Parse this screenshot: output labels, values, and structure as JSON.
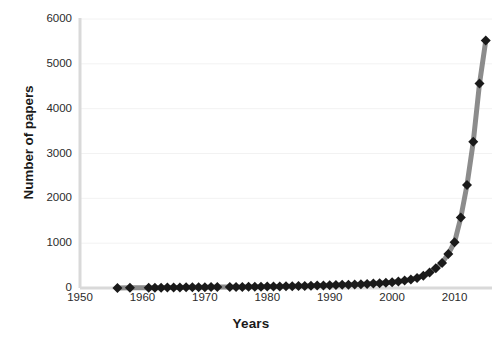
{
  "chart_data": {
    "type": "line",
    "title": "",
    "xlabel": "Years",
    "ylabel": "Number of papers",
    "xlim": [
      1950,
      2016
    ],
    "ylim": [
      0,
      6000
    ],
    "grid": true,
    "legend": "none",
    "marker": "diamond",
    "marker_color": "#1a1a1a",
    "line_color": "#8c8c8c",
    "gridline_color": "#f2f2f2",
    "axis_color": "#d9d9d9",
    "x_ticks": [
      1950,
      1960,
      1970,
      1980,
      1990,
      2000,
      2010
    ],
    "x_tick_labels": [
      "1950",
      "1960",
      "1970",
      "1980",
      "1990",
      "2000",
      "2010"
    ],
    "y_ticks": [
      0,
      1000,
      2000,
      3000,
      4000,
      5000,
      6000
    ],
    "y_tick_labels": [
      "0",
      "1000",
      "2000",
      "3000",
      "4000",
      "5000",
      "6000"
    ],
    "x": [
      1956,
      1958,
      1961,
      1962,
      1963,
      1964,
      1965,
      1966,
      1967,
      1968,
      1969,
      1970,
      1971,
      1972,
      1974,
      1975,
      1976,
      1977,
      1978,
      1979,
      1980,
      1981,
      1982,
      1983,
      1984,
      1985,
      1986,
      1987,
      1988,
      1989,
      1990,
      1991,
      1992,
      1993,
      1994,
      1995,
      1996,
      1997,
      1998,
      1999,
      2000,
      2001,
      2002,
      2003,
      2004,
      2005,
      2006,
      2007,
      2008,
      2009,
      2010,
      2011,
      2012,
      2013,
      2014,
      2015
    ],
    "values": [
      2,
      3,
      4,
      6,
      8,
      10,
      12,
      13,
      15,
      16,
      18,
      19,
      20,
      21,
      22,
      24,
      25,
      27,
      28,
      30,
      32,
      34,
      36,
      38,
      40,
      43,
      46,
      50,
      54,
      58,
      62,
      66,
      70,
      75,
      80,
      86,
      92,
      100,
      108,
      118,
      130,
      145,
      165,
      190,
      225,
      275,
      345,
      440,
      560,
      760,
      1020,
      1570,
      2300,
      3260,
      4560,
      5520
    ]
  },
  "axes": {
    "y_title": "Number of papers",
    "x_title": "Years"
  }
}
